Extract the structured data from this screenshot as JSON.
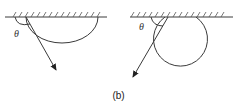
{
  "figure": {
    "caption": "(b)",
    "panels": [
      {
        "id": "left",
        "angle_label": "θ",
        "description": "Surface with hatching; a downward semicircular arc from the contact point and a straight arrow emerging at angle θ"
      },
      {
        "id": "right",
        "angle_label": "θ",
        "description": "Surface with hatching; a full circle touching the surface and a straight arrow emerging down-left at angle θ"
      }
    ],
    "colors": {
      "line": "#3a3a3a",
      "text": "#222222",
      "background": "#ffffff"
    }
  }
}
